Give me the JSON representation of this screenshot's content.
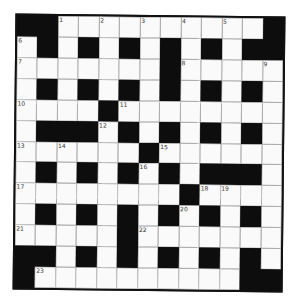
{
  "puzzle": {
    "rows": 13,
    "cols": 13,
    "colors": {
      "block": "#0d0d0d",
      "cell": "#fafafa",
      "gridline": "#9a9a9a",
      "border": "#111111"
    },
    "layout": [
      "##.........#",
      ".#.#.#.#.#.##",
      ".......#.....",
      ".#.#.#.#.#.#.",
      "....#........",
      ".###.#.#.#.#.",
      "......#......",
      ".#.#.#.#.###.",
      "........#....",
      ".#.#.#.#.#.#.",
      ".....#.......",
      "##.#.#.#.#.#.",
      "#..........##"
    ],
    "grid": [
      [
        1,
        1,
        0,
        0,
        0,
        0,
        0,
        0,
        0,
        0,
        0,
        0,
        1
      ],
      [
        0,
        1,
        0,
        1,
        0,
        1,
        0,
        1,
        0,
        1,
        0,
        1,
        1
      ],
      [
        0,
        0,
        0,
        0,
        0,
        0,
        0,
        1,
        0,
        0,
        0,
        0,
        0
      ],
      [
        0,
        1,
        0,
        1,
        0,
        1,
        0,
        1,
        0,
        1,
        0,
        1,
        0
      ],
      [
        0,
        0,
        0,
        0,
        1,
        0,
        0,
        0,
        0,
        0,
        0,
        0,
        0
      ],
      [
        0,
        1,
        1,
        1,
        0,
        1,
        0,
        1,
        0,
        1,
        0,
        1,
        0
      ],
      [
        0,
        0,
        0,
        0,
        0,
        0,
        1,
        0,
        0,
        0,
        0,
        0,
        0
      ],
      [
        0,
        1,
        0,
        1,
        0,
        1,
        0,
        1,
        0,
        1,
        1,
        1,
        0
      ],
      [
        0,
        0,
        0,
        0,
        0,
        0,
        0,
        0,
        1,
        0,
        0,
        0,
        0
      ],
      [
        0,
        1,
        0,
        1,
        0,
        1,
        0,
        1,
        0,
        1,
        0,
        1,
        0
      ],
      [
        0,
        0,
        0,
        0,
        0,
        1,
        0,
        0,
        0,
        0,
        0,
        0,
        0
      ],
      [
        1,
        1,
        0,
        1,
        0,
        1,
        0,
        1,
        0,
        1,
        0,
        1,
        0
      ],
      [
        1,
        0,
        0,
        0,
        0,
        0,
        0,
        0,
        0,
        0,
        0,
        1,
        1
      ]
    ],
    "numbers": [
      {
        "r": 0,
        "c": 2,
        "n": "1"
      },
      {
        "r": 0,
        "c": 4,
        "n": "2"
      },
      {
        "r": 0,
        "c": 6,
        "n": "3"
      },
      {
        "r": 0,
        "c": 8,
        "n": "4"
      },
      {
        "r": 0,
        "c": 10,
        "n": "5"
      },
      {
        "r": 1,
        "c": 0,
        "n": "6"
      },
      {
        "r": 2,
        "c": 0,
        "n": "7"
      },
      {
        "r": 2,
        "c": 8,
        "n": "8"
      },
      {
        "r": 2,
        "c": 12,
        "n": "9"
      },
      {
        "r": 4,
        "c": 0,
        "n": "10"
      },
      {
        "r": 4,
        "c": 5,
        "n": "11"
      },
      {
        "r": 5,
        "c": 4,
        "n": "12"
      },
      {
        "r": 6,
        "c": 0,
        "n": "13"
      },
      {
        "r": 6,
        "c": 2,
        "n": "14"
      },
      {
        "r": 6,
        "c": 7,
        "n": "15"
      },
      {
        "r": 7,
        "c": 6,
        "n": "16"
      },
      {
        "r": 8,
        "c": 0,
        "n": "17"
      },
      {
        "r": 8,
        "c": 9,
        "n": "18"
      },
      {
        "r": 8,
        "c": 10,
        "n": "19"
      },
      {
        "r": 9,
        "c": 8,
        "n": "20"
      },
      {
        "r": 10,
        "c": 0,
        "n": "21"
      },
      {
        "r": 10,
        "c": 6,
        "n": "22"
      },
      {
        "r": 12,
        "c": 1,
        "n": "23"
      }
    ]
  }
}
